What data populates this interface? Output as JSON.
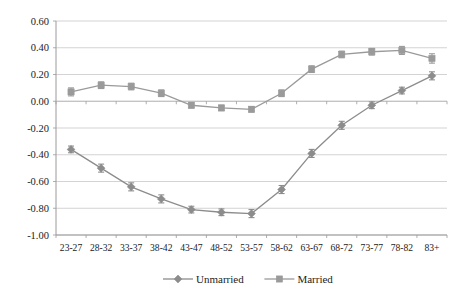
{
  "chart_data": {
    "type": "line",
    "title": "",
    "subtitle": "",
    "xlabel": "",
    "ylabel": "",
    "categories": [
      "23-27",
      "28-32",
      "33-37",
      "38-42",
      "43-47",
      "48-52",
      "53-57",
      "58-62",
      "63-67",
      "68-72",
      "73-77",
      "78-82",
      "83+"
    ],
    "ylim": [
      -1.0,
      0.6
    ],
    "ytick_labels": [
      "0.60",
      "0.40",
      "0.20",
      "0.00",
      "-0.20",
      "-0.40",
      "-0.60",
      "-0.80",
      "-1.00"
    ],
    "ytick_values": [
      0.6,
      0.4,
      0.2,
      0.0,
      -0.2,
      -0.4,
      -0.6,
      -0.8,
      -1.0
    ],
    "grid": true,
    "legend_position": "bottom",
    "series": [
      {
        "name": "Unmarried",
        "marker": "diamond",
        "color": "#8c8c8c",
        "values": [
          -0.36,
          -0.5,
          -0.64,
          -0.73,
          -0.81,
          -0.83,
          -0.84,
          -0.66,
          -0.39,
          -0.18,
          -0.03,
          0.08,
          0.19
        ],
        "errors": [
          0.025,
          0.03,
          0.03,
          0.03,
          0.025,
          0.025,
          0.03,
          0.03,
          0.03,
          0.03,
          0.025,
          0.025,
          0.03
        ]
      },
      {
        "name": "Married",
        "marker": "square",
        "color": "#9a9a9a",
        "values": [
          0.07,
          0.12,
          0.11,
          0.06,
          -0.03,
          -0.05,
          -0.06,
          0.06,
          0.24,
          0.35,
          0.37,
          0.38,
          0.32
        ],
        "errors": [
          0.03,
          0.025,
          0.025,
          0.025,
          0.02,
          0.02,
          0.02,
          0.025,
          0.025,
          0.025,
          0.025,
          0.03,
          0.035
        ]
      }
    ]
  },
  "legend": {
    "items": [
      {
        "label": "Unmarried",
        "marker": "diamond"
      },
      {
        "label": "Married",
        "marker": "square"
      }
    ]
  },
  "colors": {
    "unmarried": "#8c8c8c",
    "married": "#9a9a9a",
    "grid": "#c8c8c8",
    "axis": "#9a9a9a",
    "text": "#222222"
  }
}
